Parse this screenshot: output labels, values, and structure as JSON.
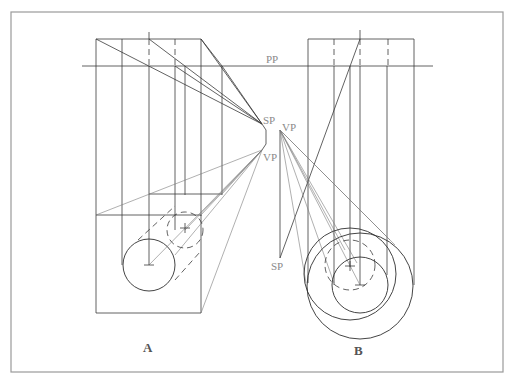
{
  "figure": {
    "labels": {
      "picture_plane": "PP",
      "station_point_a": "SP",
      "vanishing_point_a": "VP",
      "vanishing_point_b": "VP",
      "station_point_b": "SP"
    },
    "panels": [
      {
        "id": "A",
        "caption": "A",
        "description": "Box with cylinder projected toward vanishing point; front circle and dashed rear circle"
      },
      {
        "id": "B",
        "caption": "B",
        "description": "Concentric circles projected from vanishing point, rectangular plan above picture plane"
      }
    ],
    "colors": {
      "line": "#3a3a3a",
      "projector": "#7a7a7a",
      "label": "#8a8a8a",
      "frame": "#9a9a9a"
    }
  }
}
